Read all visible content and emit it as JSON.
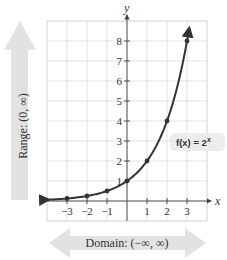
{
  "chart_data": {
    "type": "line",
    "title": "",
    "function_label": "f(x) = 2",
    "function_exponent": "x",
    "xlabel": "x",
    "ylabel": "y",
    "xlim": [
      -4,
      4
    ],
    "ylim": [
      -1,
      9
    ],
    "grid": true,
    "x_ticks": [
      -3,
      -2,
      -1,
      1,
      2,
      3
    ],
    "x_tick_labels": [
      "−3",
      "−2",
      "−1",
      "1",
      "2",
      "3"
    ],
    "y_ticks": [
      1,
      2,
      3,
      4,
      5,
      6,
      7,
      8
    ],
    "y_tick_labels": [
      "1",
      "2",
      "3",
      "4",
      "5",
      "6",
      "7",
      "8"
    ],
    "series": [
      {
        "name": "f(x) = 2^x",
        "x": [
          -3,
          -2,
          -1,
          0,
          1,
          2,
          3
        ],
        "y": [
          0.125,
          0.25,
          0.5,
          1,
          2,
          4,
          8
        ]
      }
    ],
    "annotations": {
      "domain": "Domain: (−∞, ∞)",
      "range": "Range: (0, ∞)"
    }
  }
}
